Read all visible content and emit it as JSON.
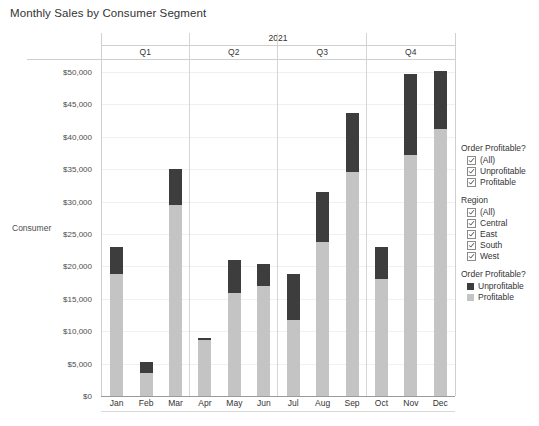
{
  "title": "Monthly Sales by Consumer Segment",
  "row_label": "Consumer",
  "year": "2021",
  "quarters": [
    "Q1",
    "Q2",
    "Q3",
    "Q4"
  ],
  "months": [
    "Jan",
    "Feb",
    "Mar",
    "Apr",
    "May",
    "Jun",
    "Jul",
    "Aug",
    "Sep",
    "Oct",
    "Nov",
    "Dec"
  ],
  "y_ticks": [
    "$0",
    "$5,000",
    "$10,000",
    "$15,000",
    "$20,000",
    "$25,000",
    "$30,000",
    "$35,000",
    "$40,000",
    "$45,000",
    "$50,000"
  ],
  "colors": {
    "unprofitable": "#3d3d3d",
    "profitable": "#c4c4c4",
    "axis": "#9a9a9a",
    "grid": "#f0f0f0",
    "text": "#333333"
  },
  "filters": [
    {
      "heading": "Order Profitable?",
      "items": [
        {
          "label": "(All)",
          "checked": true
        },
        {
          "label": "Unprofitable",
          "checked": true
        },
        {
          "label": "Profitable",
          "checked": true
        }
      ]
    },
    {
      "heading": "Region",
      "items": [
        {
          "label": "(All)",
          "checked": true
        },
        {
          "label": "Central",
          "checked": true
        },
        {
          "label": "East",
          "checked": true
        },
        {
          "label": "South",
          "checked": true
        },
        {
          "label": "West",
          "checked": true
        }
      ]
    }
  ],
  "color_legend": {
    "heading": "Order Profitable?",
    "items": [
      {
        "label": "Unprofitable",
        "color": "#3d3d3d"
      },
      {
        "label": "Profitable",
        "color": "#c4c4c4"
      }
    ]
  },
  "chart_data": {
    "type": "bar",
    "title": "Monthly Sales by Consumer Segment",
    "subtitle": "2021",
    "xlabel": "",
    "ylabel": "",
    "ylim": [
      0,
      52000
    ],
    "ytick_step": 5000,
    "grid": true,
    "stacked": true,
    "legend_position": "right",
    "categories": [
      "Jan",
      "Feb",
      "Mar",
      "Apr",
      "May",
      "Jun",
      "Jul",
      "Aug",
      "Sep",
      "Oct",
      "Nov",
      "Dec"
    ],
    "groups": [
      {
        "name": "Q1",
        "categories": [
          "Jan",
          "Feb",
          "Mar"
        ]
      },
      {
        "name": "Q2",
        "categories": [
          "Apr",
          "May",
          "Jun"
        ]
      },
      {
        "name": "Q3",
        "categories": [
          "Jul",
          "Aug",
          "Sep"
        ]
      },
      {
        "name": "Q4",
        "categories": [
          "Oct",
          "Nov",
          "Dec"
        ]
      }
    ],
    "series": [
      {
        "name": "Profitable",
        "color": "#c4c4c4",
        "values": [
          18800,
          3500,
          29500,
          8700,
          15900,
          16900,
          11800,
          23800,
          34500,
          18000,
          37200,
          41200
        ]
      },
      {
        "name": "Unprofitable",
        "color": "#3d3d3d",
        "values": [
          4200,
          1700,
          5500,
          300,
          5100,
          3500,
          7000,
          7700,
          9200,
          5000,
          12500,
          9000
        ]
      }
    ],
    "totals": [
      23000,
      5200,
      35000,
      9000,
      21000,
      20400,
      18800,
      31500,
      43700,
      23000,
      49700,
      50200
    ]
  }
}
